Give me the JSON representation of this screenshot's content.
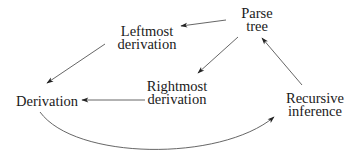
{
  "diagram": {
    "type": "flow-diagram",
    "nodes": {
      "leftmost": {
        "line1": "Leftmost",
        "line2": "derivation"
      },
      "parse_tree": {
        "line1": "Parse",
        "line2": "tree"
      },
      "rightmost": {
        "line1": "Rightmost",
        "line2": "derivation"
      },
      "derivation": {
        "label": "Derivation"
      },
      "recursive": {
        "line1": "Recursive",
        "line2": "inference"
      }
    },
    "edges": [
      {
        "from": "Parse tree",
        "to": "Leftmost derivation",
        "style": "straight"
      },
      {
        "from": "Leftmost derivation",
        "to": "Derivation",
        "style": "straight"
      },
      {
        "from": "Parse tree",
        "to": "Rightmost derivation",
        "style": "straight"
      },
      {
        "from": "Rightmost derivation",
        "to": "Derivation",
        "style": "straight"
      },
      {
        "from": "Recursive inference",
        "to": "Parse tree",
        "style": "straight"
      },
      {
        "from": "Derivation",
        "to": "Recursive inference",
        "style": "curved"
      }
    ],
    "colors": {
      "line": "#555555",
      "text": "#1a1a1a",
      "background": "#ffffff"
    }
  }
}
